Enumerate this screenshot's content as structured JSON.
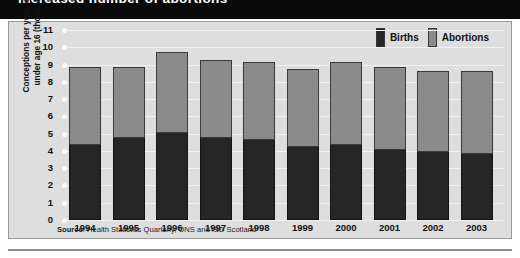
{
  "title": "increased number of abortions",
  "legend": {
    "position": "top-right",
    "items": [
      {
        "label": "Births",
        "color": "#262626",
        "name": "births"
      },
      {
        "label": "Abortions",
        "color": "#8b8b8b",
        "name": "abortions"
      }
    ]
  },
  "source": {
    "prefix": "Source",
    "text": ": Health Statistics Quarterly, ONS and ISD Scotland",
    "full": "Source: Health Statistics Quarterly, ONS and ISD Scotland"
  },
  "axes": {
    "ylabel": "Conceptions per year to girls under age 16 (thousands)",
    "xlabel": "",
    "yticks": [
      "11",
      "10",
      "9",
      "8",
      "7",
      "6",
      "5",
      "4",
      "3",
      "2",
      "1",
      "0"
    ]
  },
  "colors": {
    "banner": "#0a0a0a",
    "panel": "#dedede",
    "gridline": "#f2f2f2",
    "births": "#262626",
    "abortions": "#8b8b8b"
  },
  "chart_data": {
    "type": "bar",
    "stacked": true,
    "title": "increased number of abortions",
    "xlabel": "",
    "ylabel": "Conceptions per year to girls under age 16 (thousands)",
    "ylim": [
      0,
      11
    ],
    "ytick_step": 1,
    "grid": true,
    "legend_position": "top-right",
    "categories": [
      "1994",
      "1995",
      "1996",
      "1997",
      "1998",
      "1999",
      "2000",
      "2001",
      "2002",
      "2003"
    ],
    "series": [
      {
        "name": "Births",
        "color": "#262626",
        "values": [
          4.4,
          4.8,
          5.1,
          4.8,
          4.7,
          4.3,
          4.4,
          4.1,
          4.0,
          3.9
        ]
      },
      {
        "name": "Abortions",
        "color": "#8b8b8b",
        "values": [
          4.5,
          4.1,
          4.7,
          4.5,
          4.5,
          4.5,
          4.8,
          4.8,
          4.7,
          4.8
        ]
      }
    ],
    "totals": [
      8.9,
      8.9,
      9.8,
      9.3,
      9.2,
      8.8,
      9.2,
      8.9,
      8.7,
      8.7
    ]
  }
}
